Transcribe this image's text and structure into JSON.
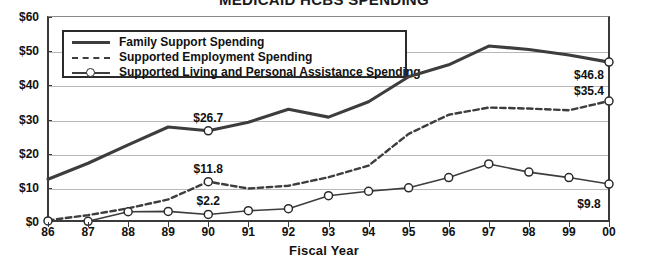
{
  "chart_data": {
    "type": "line",
    "title": "MEDICAID HCBS SPENDING",
    "xlabel": "Fiscal Year",
    "ylabel": "",
    "categories": [
      "86",
      "87",
      "88",
      "89",
      "90",
      "91",
      "92",
      "93",
      "94",
      "95",
      "96",
      "97",
      "98",
      "99",
      "00"
    ],
    "ylim": [
      0,
      60
    ],
    "ytick_labels": [
      "$0",
      "$10",
      "$20",
      "$30",
      "$40",
      "$50",
      "$60"
    ],
    "ytick_values": [
      0,
      10,
      20,
      30,
      40,
      50,
      60
    ],
    "grid": true,
    "legend_position": "top-left-inside",
    "series": [
      {
        "name": "Family Support Spending",
        "style": "solid",
        "marker": "none",
        "color": "#3d3d3d",
        "values": [
          12.5,
          17.2,
          22.6,
          27.8,
          26.7,
          29.2,
          33.0,
          30.7,
          35.2,
          42.5,
          46.0,
          51.5,
          50.5,
          48.9,
          46.8
        ]
      },
      {
        "name": "Supported Employment Spending",
        "style": "dashed",
        "marker": "none",
        "color": "#3d3d3d",
        "values": [
          0.5,
          2.0,
          4.0,
          6.6,
          11.8,
          9.8,
          10.6,
          13.1,
          16.5,
          25.8,
          31.4,
          33.5,
          33.2,
          32.7,
          35.4
        ]
      },
      {
        "name": "Supported Living and Personal Assistance Spending",
        "style": "solid",
        "marker": "circle",
        "color": "#3d3d3d",
        "values": [
          0.3,
          0.2,
          3.0,
          3.1,
          2.2,
          3.3,
          3.9,
          7.7,
          9.0,
          10.0,
          13.0,
          17.0,
          14.6,
          13.0,
          11.1
        ]
      }
    ],
    "point_labels": [
      {
        "text": "$26.7",
        "series": 0,
        "category": "90",
        "value": 26.7,
        "dx": 0,
        "dy": -14
      },
      {
        "text": "$11.8",
        "series": 1,
        "category": "90",
        "value": 11.8,
        "dx": 0,
        "dy": -14
      },
      {
        "text": "$2.2",
        "series": 2,
        "category": "90",
        "value": 2.2,
        "dx": 0,
        "dy": -14
      },
      {
        "text": "$46.8",
        "series": 0,
        "category": "00",
        "value": 46.8,
        "dx": -20,
        "dy": 12
      },
      {
        "text": "$35.4",
        "series": 1,
        "category": "00",
        "value": 35.4,
        "dx": -20,
        "dy": -11
      },
      {
        "text": "$9.8",
        "series": 2,
        "category": "00",
        "value": 9.8,
        "dx": -20,
        "dy": 14
      }
    ]
  },
  "colors": {
    "ink": "#3d3d3d",
    "grid": "#b9b9b9",
    "axis": "#3a3a3a",
    "background": "#ffffff"
  }
}
